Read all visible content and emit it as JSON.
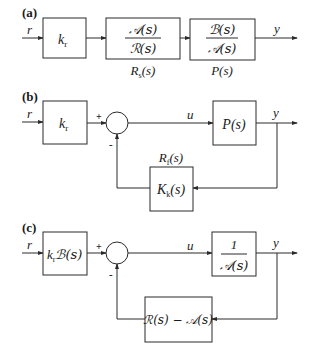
{
  "panels": [
    {
      "label": "(a)",
      "input": "r",
      "output": "y",
      "blocks": [
        {
          "name": "gain",
          "text": "k",
          "sub": "r"
        },
        {
          "name": "Rs",
          "num": "𝒜(s)",
          "den": "ℛ(s)",
          "caption": "R",
          "caption_sub": "s",
          "caption_tail": "(s)"
        },
        {
          "name": "plant",
          "num": "ℬ(s)",
          "den": "𝒜(s)",
          "caption": "P(s)"
        }
      ]
    },
    {
      "label": "(b)",
      "input": "r",
      "signal_u": "u",
      "output": "y",
      "plus": "+",
      "minus": "-",
      "blocks": [
        {
          "name": "gain",
          "text": "k",
          "sub": "r"
        },
        {
          "name": "plant",
          "text": "P(s)"
        },
        {
          "name": "feedback",
          "text": "K",
          "sub": "k",
          "tail": "(s)",
          "caption": "R",
          "caption_sub": "f",
          "caption_tail": "(s)"
        }
      ]
    },
    {
      "label": "(c)",
      "input": "r",
      "signal_u": "u",
      "output": "y",
      "plus": "+",
      "minus": "-",
      "blocks": [
        {
          "name": "gain",
          "text": "k",
          "sub": "r",
          "tail": "ℬ(s)"
        },
        {
          "name": "plant",
          "num": "1",
          "den": "𝒜(s)"
        },
        {
          "name": "feedback",
          "text": "ℛ(s) − 𝒜(s)"
        }
      ]
    }
  ]
}
